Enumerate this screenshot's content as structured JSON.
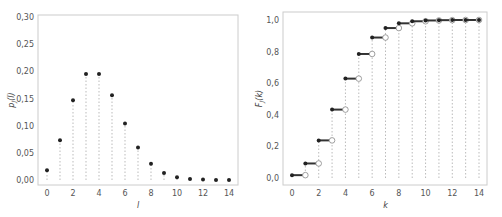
{
  "chart_data": [
    {
      "type": "scatter",
      "title": "",
      "xlabel": "l",
      "ylabel": "p_J(l)",
      "xlim": [
        0,
        14
      ],
      "ylim": [
        0,
        0.3
      ],
      "xticks": [
        "0",
        "2",
        "4",
        "6",
        "8",
        "10",
        "12",
        "14"
      ],
      "yticks": [
        "0,00",
        "0,05",
        "0,10",
        "0,15",
        "0,20",
        "0,25",
        "0,30"
      ],
      "grid": false,
      "style": "stem plot with dotted vertical lines and filled markers",
      "x": [
        0,
        1,
        2,
        3,
        4,
        5,
        6,
        7,
        8,
        9,
        10,
        11,
        12,
        13,
        14
      ],
      "values": [
        0.018,
        0.073,
        0.147,
        0.195,
        0.195,
        0.156,
        0.104,
        0.06,
        0.03,
        0.013,
        0.005,
        0.002,
        0.001,
        0.0002,
        0.0001
      ]
    },
    {
      "type": "line",
      "title": "",
      "xlabel": "k",
      "ylabel": "F_J(k)",
      "xlim": [
        0,
        14
      ],
      "ylim": [
        0,
        1.0
      ],
      "xticks": [
        "0",
        "2",
        "4",
        "6",
        "8",
        "10",
        "12",
        "14"
      ],
      "yticks": [
        "0,0",
        "0,2",
        "0,4",
        "0,6",
        "0,8",
        "1,0"
      ],
      "grid": false,
      "style": "step CDF: filled dot at left end, open circle at right end, dotted vertical guides",
      "x": [
        0,
        1,
        2,
        3,
        4,
        5,
        6,
        7,
        8,
        9,
        10,
        11,
        12,
        13,
        14
      ],
      "values": [
        0.018,
        0.092,
        0.238,
        0.433,
        0.629,
        0.785,
        0.889,
        0.949,
        0.979,
        0.992,
        0.997,
        0.999,
        1.0,
        1.0,
        1.0
      ]
    }
  ],
  "left": {
    "ylabel_main": "p",
    "ylabel_sub": "J",
    "ylabel_arg": "(l)",
    "xlabel": "l"
  },
  "right": {
    "ylabel_main": "F",
    "ylabel_sub": "J",
    "ylabel_arg": "(k)",
    "xlabel": "k"
  },
  "colors": {
    "marker": "#222222",
    "frame": "#cccccc",
    "dotted": "#bbbbbb",
    "step": "#333333"
  }
}
